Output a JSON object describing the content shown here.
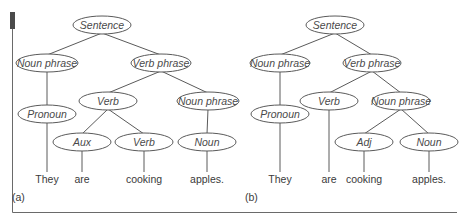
{
  "figure": {
    "panels": [
      {
        "label": "(a)",
        "nodes": [
          {
            "id": "s",
            "text": "Sentence",
            "x": 102,
            "y": 25,
            "rx": 29
          },
          {
            "id": "np1",
            "text": "Noun phrase",
            "x": 47,
            "y": 63,
            "rx": 31
          },
          {
            "id": "vp",
            "text": "Verb phrase",
            "x": 161,
            "y": 63,
            "rx": 30
          },
          {
            "id": "pro",
            "text": "Pronoun",
            "x": 47,
            "y": 114,
            "rx": 29
          },
          {
            "id": "verb",
            "text": "Verb",
            "x": 108,
            "y": 101,
            "rx": 29
          },
          {
            "id": "np2",
            "text": "Noun phrase",
            "x": 208,
            "y": 101,
            "rx": 31
          },
          {
            "id": "aux",
            "text": "Aux",
            "x": 82,
            "y": 142,
            "rx": 29
          },
          {
            "id": "verb2",
            "text": "Verb",
            "x": 144,
            "y": 142,
            "rx": 29
          },
          {
            "id": "noun",
            "text": "Noun",
            "x": 207,
            "y": 142,
            "rx": 29
          }
        ],
        "edges": [
          [
            "s",
            "np1"
          ],
          [
            "s",
            "vp"
          ],
          [
            "np1",
            "pro"
          ],
          [
            "vp",
            "verb"
          ],
          [
            "vp",
            "np2"
          ],
          [
            "verb",
            "aux"
          ],
          [
            "verb",
            "verb2"
          ],
          [
            "np2",
            "noun"
          ]
        ],
        "words": [
          {
            "text": "They",
            "x": 47,
            "parent": "pro"
          },
          {
            "text": "are",
            "x": 82,
            "parent": "aux"
          },
          {
            "text": "cooking",
            "x": 144,
            "parent": "verb2"
          },
          {
            "text": "apples.",
            "x": 207,
            "parent": "noun"
          }
        ]
      },
      {
        "label": "(b)",
        "nodes": [
          {
            "id": "s",
            "text": "Sentence",
            "x": 335,
            "y": 25,
            "rx": 29
          },
          {
            "id": "np1",
            "text": "Noun phrase",
            "x": 280,
            "y": 63,
            "rx": 30
          },
          {
            "id": "vp",
            "text": "Verb phrase",
            "x": 372,
            "y": 63,
            "rx": 29
          },
          {
            "id": "pro",
            "text": "Pronoun",
            "x": 280,
            "y": 114,
            "rx": 29
          },
          {
            "id": "verb",
            "text": "Verb",
            "x": 329,
            "y": 101,
            "rx": 29
          },
          {
            "id": "np2",
            "text": "Noun phrase",
            "x": 401,
            "y": 101,
            "rx": 29
          },
          {
            "id": "adj",
            "text": "Adj",
            "x": 364,
            "y": 142,
            "rx": 29
          },
          {
            "id": "noun",
            "text": "Noun",
            "x": 429,
            "y": 142,
            "rx": 29
          }
        ],
        "edges": [
          [
            "s",
            "np1"
          ],
          [
            "s",
            "vp"
          ],
          [
            "np1",
            "pro"
          ],
          [
            "vp",
            "verb"
          ],
          [
            "vp",
            "np2"
          ],
          [
            "np2",
            "adj"
          ],
          [
            "np2",
            "noun"
          ]
        ],
        "words": [
          {
            "text": "They",
            "x": 280,
            "parent": "pro"
          },
          {
            "text": "are",
            "x": 329,
            "parent": "verb"
          },
          {
            "text": "cooking",
            "x": 364,
            "parent": "adj"
          },
          {
            "text": "apples.",
            "x": 429,
            "parent": "noun"
          }
        ]
      }
    ],
    "word_y": 183,
    "label_y": 201,
    "label_x": [
      12,
      245
    ],
    "node_ry": 9,
    "colors": {
      "stroke": "#5a5a5a",
      "text": "#4a4a4a",
      "frame": "#6a6a6a"
    }
  }
}
